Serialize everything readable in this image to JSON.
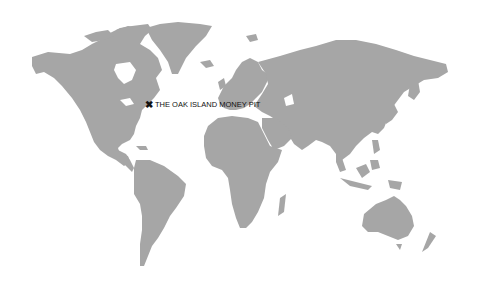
{
  "map": {
    "type": "world-map",
    "land_color": "#a6a6a6",
    "background_color": "#ffffff"
  },
  "marker": {
    "icon": "x-marker-icon",
    "glyph": "✖",
    "label": "THE OAK ISLAND MONEY PIT",
    "color": "#111111",
    "position_px": [
      150,
      105
    ]
  }
}
